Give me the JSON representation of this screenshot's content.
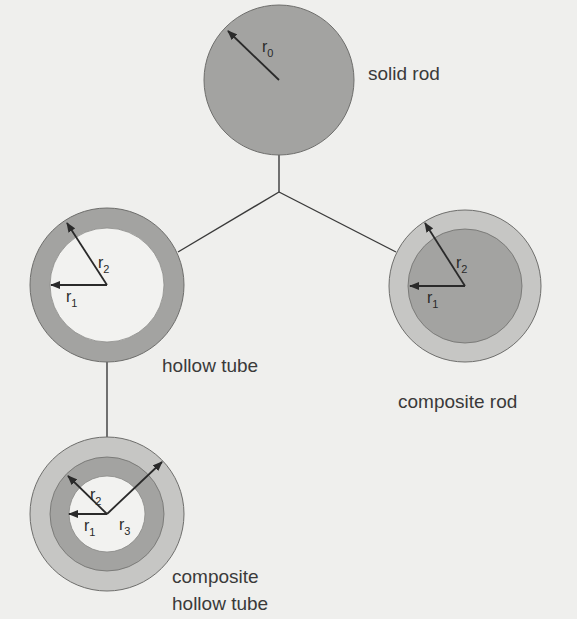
{
  "colors": {
    "background": "#efefed",
    "dark_fill": "#a3a3a1",
    "light_fill": "#c6c6c4",
    "hollow_fill": "#f2f2f0",
    "outline": "#6e6e6c",
    "text": "#3a3a3a"
  },
  "diagram": {
    "junction": {
      "x": 279,
      "y": 192
    },
    "shapes": [
      {
        "id": "solid-rod",
        "label": "solid rod",
        "radii": [
          "r",
          "0"
        ]
      },
      {
        "id": "hollow-tube",
        "label": "hollow tube",
        "radii": [
          "r1",
          "r2"
        ]
      },
      {
        "id": "composite-rod",
        "label": "composite rod",
        "radii": [
          "r1",
          "r2"
        ]
      },
      {
        "id": "composite-hollow-tube",
        "label": "composite hollow tube",
        "radii": [
          "r1",
          "r2",
          "r3"
        ]
      }
    ]
  },
  "labels": {
    "solid_rod": "solid rod",
    "hollow_tube": "hollow tube",
    "composite_rod": "composite rod",
    "composite_hollow_tube_line1": "composite",
    "composite_hollow_tube_line2": "hollow tube"
  },
  "symbols": {
    "r": "r",
    "sub0": "0",
    "sub1": "1",
    "sub2": "2",
    "sub3": "3"
  }
}
